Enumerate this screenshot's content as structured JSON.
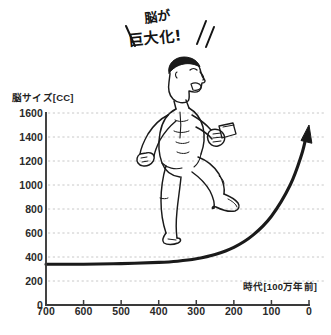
{
  "annotation": {
    "line1": "脳が",
    "line2": "巨大化!"
  },
  "axes": {
    "y_title": "脳サイズ[CC]",
    "x_title": "時代[100万年前]"
  },
  "colors": {
    "background": "#ffffff",
    "ink": "#1a1a1a",
    "axis": "#3a3a3a",
    "grid": "#c8c8c8",
    "label": "#2a2a2a"
  },
  "chart_data": {
    "type": "line",
    "xlabel": "時代[100万年前]",
    "ylabel": "脳サイズ[CC]",
    "xlim": [
      700,
      0
    ],
    "ylim": [
      0,
      1600
    ],
    "x_reversed": true,
    "grid": true,
    "legend": null,
    "xticks": [
      700,
      600,
      500,
      400,
      300,
      200,
      100,
      0
    ],
    "yticks": [
      0,
      200,
      400,
      600,
      800,
      1000,
      1200,
      1400,
      1600
    ],
    "series": [
      {
        "name": "脳サイズ",
        "x": [
          700,
          600,
          500,
          400,
          350,
          300,
          250,
          200,
          150,
          100,
          50,
          20,
          0
        ],
        "values": [
          340,
          340,
          345,
          355,
          365,
          385,
          420,
          480,
          580,
          740,
          1000,
          1250,
          1500
        ],
        "arrow_end": true
      }
    ],
    "annotations": [
      {
        "text": "脳が 巨大化!",
        "x": 420,
        "y": 1700,
        "style": "handwritten"
      }
    ]
  },
  "illustration": {
    "name": "running-human-figure",
    "description": "走るヒトの線画"
  }
}
